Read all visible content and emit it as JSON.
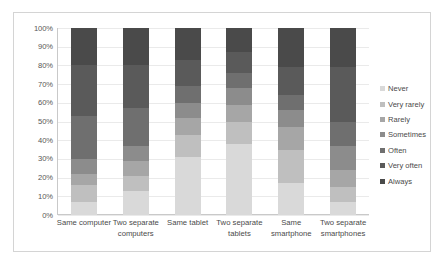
{
  "chart_data": {
    "type": "bar",
    "subtype": "stacked-percentage-column",
    "title": "",
    "xlabel": "",
    "ylabel": "",
    "ylim": [
      0,
      100
    ],
    "ytick_labels": [
      "100%",
      "90%",
      "80%",
      "70%",
      "60%",
      "50%",
      "40%",
      "30%",
      "20%",
      "10%",
      "0%"
    ],
    "ytick_values": [
      100,
      90,
      80,
      70,
      60,
      50,
      40,
      30,
      20,
      10,
      0
    ],
    "grid": true,
    "legend_position": "right",
    "stack_order_bottom_to_top": [
      "Never",
      "Very rarely",
      "Rarely",
      "Sometimes",
      "Often",
      "Very often",
      "Always"
    ],
    "categories": [
      "Same computer",
      "Two separate computers",
      "Same tablet",
      "Two separate tablets",
      "Same smartphone",
      "Two separate smartphones"
    ],
    "series": [
      {
        "name": "Never",
        "color": "#d9d9d9",
        "values": [
          7,
          13,
          31,
          38,
          17,
          7
        ]
      },
      {
        "name": "Very rarely",
        "color": "#bfbfbf",
        "values": [
          9,
          8,
          12,
          12,
          18,
          8
        ]
      },
      {
        "name": "Rarely",
        "color": "#a6a6a6",
        "values": [
          6,
          8,
          9,
          9,
          12,
          9
        ]
      },
      {
        "name": "Sometimes",
        "color": "#8c8c8c",
        "values": [
          8,
          8,
          8,
          9,
          9,
          13
        ]
      },
      {
        "name": "Often",
        "color": "#6f6f6f",
        "values": [
          23,
          20,
          9,
          8,
          8,
          13
        ]
      },
      {
        "name": "Very often",
        "color": "#5a5a5a",
        "values": [
          27,
          23,
          14,
          11,
          15,
          29
        ]
      },
      {
        "name": "Always",
        "color": "#4a4a4a",
        "values": [
          20,
          20,
          17,
          13,
          21,
          21
        ]
      }
    ]
  },
  "legend": {
    "items": [
      {
        "label": "Never"
      },
      {
        "label": "Very rarely"
      },
      {
        "label": "Rarely"
      },
      {
        "label": "Sometimes"
      },
      {
        "label": "Often"
      },
      {
        "label": "Very often"
      },
      {
        "label": "Always"
      }
    ]
  },
  "caption": {
    "text": ""
  }
}
